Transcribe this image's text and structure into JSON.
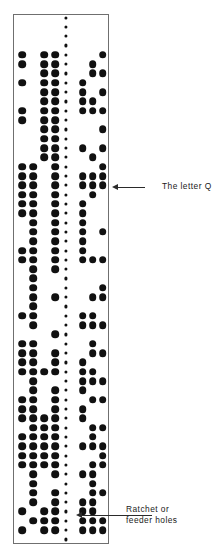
{
  "figure": {
    "type": "paper-tape-diagram",
    "tape": {
      "edge_color": "#6f6f6f",
      "hole_color": "#111111",
      "left_px": 13,
      "right_px": 109,
      "top_px": 14,
      "bottom_px": 544,
      "data_track_count": 8,
      "feeder_track_index": 5,
      "track_x": [
        22.0,
        33.0,
        44.0,
        55.0,
        65.5,
        72.0,
        82.5,
        92.5,
        102.5
      ],
      "row_pitch": 9.32,
      "first_row_y": 17.5,
      "row_count": 57,
      "feeder_hole_rows": "all",
      "punched_rows": [
        {
          "row": 5,
          "tracks": [
            1,
            3,
            4,
            9
          ]
        },
        {
          "row": 6,
          "tracks": [
            1,
            3,
            4,
            8
          ]
        },
        {
          "row": 7,
          "tracks": [
            3,
            4,
            8,
            9
          ]
        },
        {
          "row": 8,
          "tracks": [
            1,
            3,
            4,
            7
          ]
        },
        {
          "row": 9,
          "tracks": [
            3,
            4,
            7,
            9
          ]
        },
        {
          "row": 10,
          "tracks": [
            3,
            4,
            7,
            8
          ]
        },
        {
          "row": 11,
          "tracks": [
            1,
            3,
            4,
            7,
            8,
            9
          ]
        },
        {
          "row": 12,
          "tracks": [
            1,
            3,
            4,
            5
          ]
        },
        {
          "row": 13,
          "tracks": [
            3,
            4,
            5,
            9
          ]
        },
        {
          "row": 14,
          "tracks": [
            3,
            4,
            5
          ]
        },
        {
          "row": 15,
          "tracks": [
            3,
            4,
            7,
            9
          ]
        },
        {
          "row": 16,
          "tracks": [
            3,
            4,
            8
          ]
        },
        {
          "row": 17,
          "tracks": [
            1,
            2,
            4,
            9
          ]
        },
        {
          "row": 18,
          "tracks": [
            1,
            2,
            4,
            7,
            8,
            9
          ]
        },
        {
          "row": 19,
          "tracks": [
            1,
            2,
            4,
            7,
            8,
            9
          ]
        },
        {
          "row": 20,
          "tracks": [
            1,
            2,
            4,
            8
          ]
        },
        {
          "row": 21,
          "tracks": [
            1,
            2,
            4,
            7
          ]
        },
        {
          "row": 22,
          "tracks": [
            1,
            2,
            4,
            7
          ]
        },
        {
          "row": 23,
          "tracks": [
            2,
            4,
            5,
            7
          ]
        },
        {
          "row": 24,
          "tracks": [
            2,
            4,
            7,
            9
          ]
        },
        {
          "row": 25,
          "tracks": [
            2,
            4,
            7
          ]
        },
        {
          "row": 26,
          "tracks": [
            1,
            2,
            4,
            5,
            7
          ]
        },
        {
          "row": 27,
          "tracks": [
            1,
            2,
            4,
            5,
            7,
            8,
            9
          ]
        },
        {
          "row": 28,
          "tracks": [
            2,
            4
          ]
        },
        {
          "row": 29,
          "tracks": [
            2
          ]
        },
        {
          "row": 30,
          "tracks": [
            2,
            9
          ]
        },
        {
          "row": 31,
          "tracks": [
            2,
            4,
            8,
            9
          ]
        },
        {
          "row": 32,
          "tracks": [
            2
          ]
        },
        {
          "row": 33,
          "tracks": [
            1,
            2,
            7,
            8
          ]
        },
        {
          "row": 34,
          "tracks": [
            2,
            7,
            8,
            9
          ]
        },
        {
          "row": 35,
          "tracks": [
            4,
            5
          ]
        },
        {
          "row": 36,
          "tracks": [
            1,
            2,
            8
          ]
        },
        {
          "row": 37,
          "tracks": [
            1,
            2,
            4,
            8,
            9
          ]
        },
        {
          "row": 38,
          "tracks": [
            1,
            2,
            4,
            7
          ]
        },
        {
          "row": 39,
          "tracks": [
            1,
            2,
            3,
            4,
            7,
            8
          ]
        },
        {
          "row": 40,
          "tracks": [
            2,
            7,
            8,
            9
          ]
        },
        {
          "row": 41,
          "tracks": [
            2,
            4,
            7
          ]
        },
        {
          "row": 42,
          "tracks": [
            1,
            2,
            4,
            8,
            9
          ]
        },
        {
          "row": 43,
          "tracks": [
            1,
            2,
            4,
            7
          ]
        },
        {
          "row": 44,
          "tracks": [
            1,
            2,
            3,
            4,
            7
          ]
        },
        {
          "row": 45,
          "tracks": [
            2,
            3,
            4,
            5,
            8,
            9
          ]
        },
        {
          "row": 46,
          "tracks": [
            1,
            2,
            3,
            4,
            5,
            8
          ]
        },
        {
          "row": 47,
          "tracks": [
            1,
            2,
            3,
            4,
            5,
            7,
            8,
            9
          ]
        },
        {
          "row": 48,
          "tracks": [
            1,
            2,
            3,
            4,
            5,
            9
          ]
        },
        {
          "row": 49,
          "tracks": [
            1,
            2,
            3,
            4,
            8,
            9
          ]
        },
        {
          "row": 50,
          "tracks": [
            2,
            4,
            7,
            8
          ]
        },
        {
          "row": 51,
          "tracks": [
            2,
            8
          ]
        },
        {
          "row": 52,
          "tracks": [
            2,
            4,
            5,
            8,
            9
          ]
        },
        {
          "row": 53,
          "tracks": [
            2,
            4,
            5,
            7,
            8
          ]
        },
        {
          "row": 54,
          "tracks": [
            1,
            3,
            4,
            5,
            7,
            8
          ]
        },
        {
          "row": 55,
          "tracks": [
            2,
            3,
            4,
            5,
            7,
            8,
            9
          ]
        },
        {
          "row": 56,
          "tracks": [
            1,
            3,
            4,
            7,
            8,
            9
          ]
        }
      ]
    },
    "annotations": [
      {
        "id": "letter-q",
        "text": "The letter Q",
        "arrow_y": 187,
        "arrow_tip_x": 112,
        "leader_from_x": 118,
        "leader_to_x": 145
      },
      {
        "id": "feeder-holes",
        "line1": "Ratchet or",
        "line2": "feeder holes",
        "arrow_y": 515,
        "arrow_tip_x": 76,
        "leader_from_x": 82,
        "leader_to_x": 152
      }
    ]
  }
}
